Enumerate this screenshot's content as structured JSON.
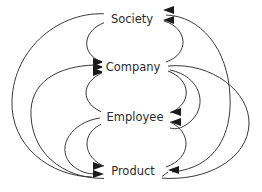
{
  "diagram": {
    "type": "directed-graph",
    "background_color": "#ffffff",
    "line_color": "#3a3a3a",
    "text_color": "#2b2b2b",
    "arrow_color": "#1a1a1a",
    "nodes": [
      {
        "id": "society",
        "label": "Society",
        "x": 131,
        "y": 18
      },
      {
        "id": "company",
        "label": "Company",
        "x": 131,
        "y": 66
      },
      {
        "id": "employee",
        "label": "Employee",
        "x": 131,
        "y": 116
      },
      {
        "id": "product",
        "label": "Product",
        "x": 131,
        "y": 170
      }
    ],
    "edges": [
      {
        "from": "society",
        "to": "company",
        "style": "inner-left-arc"
      },
      {
        "from": "company",
        "to": "society",
        "style": "inner-right-arc"
      },
      {
        "from": "company",
        "to": "employee",
        "style": "inner-left-arc"
      },
      {
        "from": "employee",
        "to": "company",
        "style": "inner-right-arc"
      },
      {
        "from": "employee",
        "to": "product",
        "style": "inner-left-arc"
      },
      {
        "from": "product",
        "to": "employee",
        "style": "inner-right-arc"
      },
      {
        "from": "society",
        "to": "product",
        "style": "outer-left-arc"
      },
      {
        "from": "product",
        "to": "company",
        "style": "outer-left-arc"
      },
      {
        "from": "company",
        "to": "product",
        "style": "outer-right-arc"
      },
      {
        "from": "product",
        "to": "society",
        "style": "outer-right-arc"
      },
      {
        "from": "employee",
        "to": "product",
        "style": "mid-left-arc"
      },
      {
        "from": "company",
        "to": "employee",
        "style": "mid-right-arc"
      }
    ],
    "arrowheads_in": {
      "society": 2,
      "company": 3,
      "employee": 2,
      "product": 3
    }
  }
}
